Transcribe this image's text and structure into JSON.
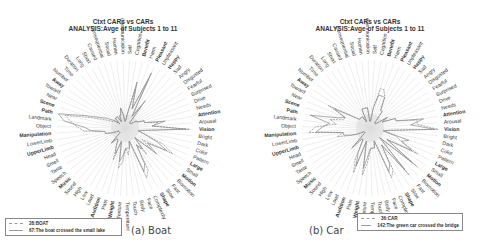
{
  "chart_data": [
    {
      "type": "radar",
      "panel": "a",
      "title": "Ctxt CARs vs CARs",
      "subtitle": "ANALYSIS:Avge of Subjects 1 to 11",
      "caption": "(a) Boat",
      "axes": [
        "Vision",
        "Bright",
        "Dark",
        "Color",
        "Pattern",
        "Large",
        "Small",
        "Motion",
        "Biomotion",
        "Fast",
        "Slow",
        "Shape",
        "Complexity",
        "Face",
        "Body",
        "Touch",
        "Temperature",
        "Texture",
        "Weight",
        "Pain",
        "Audition",
        "Loud",
        "Low",
        "High",
        "Sound",
        "Music",
        "Speech",
        "Taste",
        "Smell",
        "Head",
        "UpperLimb",
        "LowerLimb",
        "Manipulation",
        "Object",
        "Landmark",
        "Path",
        "Scene",
        "Near",
        "Toward",
        "Away",
        "Number",
        "Time",
        "Duration",
        "Long",
        "Short",
        "Caused",
        "Consequential",
        "Social",
        "Human",
        "Communication",
        "Self",
        "Cognition",
        "Benefit",
        "Harm",
        "Pleasant",
        "Unpleasant",
        "Happy",
        "Sad",
        "Angry",
        "Disgusted",
        "Fearful",
        "Surprised",
        "Drive",
        "Needs",
        "Attention",
        "Arousal"
      ],
      "series": [
        {
          "name": "28:BOAT",
          "style": "dashed",
          "values": [
            0.95,
            0.3,
            0.2,
            0.3,
            0.6,
            0.8,
            0.3,
            0.5,
            0.2,
            0.5,
            0.3,
            0.7,
            0.8,
            0.2,
            0.3,
            0.4,
            0.3,
            0.5,
            0.6,
            0.2,
            0.5,
            0.3,
            0.2,
            0.2,
            0.3,
            0.1,
            0.1,
            0.1,
            0.1,
            0.2,
            0.3,
            0.3,
            0.6,
            0.7,
            0.8,
            0.9,
            0.5,
            0.3,
            0.2,
            0.2,
            0.1,
            0.2,
            0.2,
            0.2,
            0.1,
            0.2,
            0.2,
            0.3,
            0.2,
            0.1,
            0.1,
            0.2,
            0.6,
            0.3,
            0.8,
            0.2,
            0.4,
            0.1,
            0.1,
            0.1,
            0.2,
            0.2,
            0.3,
            0.3,
            0.5,
            0.4
          ]
        },
        {
          "name": "67:The boat crossed the small lake",
          "style": "solid",
          "values": [
            0.9,
            0.3,
            0.2,
            0.3,
            0.5,
            0.7,
            0.4,
            0.6,
            0.2,
            0.4,
            0.3,
            0.6,
            0.7,
            0.2,
            0.3,
            0.3,
            0.3,
            0.4,
            0.5,
            0.2,
            0.4,
            0.3,
            0.2,
            0.2,
            0.3,
            0.1,
            0.1,
            0.1,
            0.1,
            0.2,
            0.3,
            0.3,
            0.5,
            0.6,
            0.9,
            1.0,
            0.6,
            0.4,
            0.3,
            0.2,
            0.1,
            0.2,
            0.2,
            0.2,
            0.1,
            0.2,
            0.2,
            0.3,
            0.2,
            0.1,
            0.1,
            0.2,
            0.7,
            0.3,
            0.9,
            0.2,
            0.5,
            0.1,
            0.1,
            0.1,
            0.2,
            0.2,
            0.3,
            0.3,
            0.6,
            0.4
          ]
        }
      ]
    },
    {
      "type": "radar",
      "panel": "b",
      "title": "Ctxt CARs vs CARs",
      "subtitle": "ANALYSIS:Avge of Subjects 1 to 11",
      "caption": "(b) Car",
      "axes": [
        "Vision",
        "Bright",
        "Dark",
        "Color",
        "Pattern",
        "Large",
        "Small",
        "Motion",
        "Biomotion",
        "Fast",
        "Slow",
        "Shape",
        "Complexity",
        "Face",
        "Body",
        "Touch",
        "Temperature",
        "Texture",
        "Weight",
        "Pain",
        "Audition",
        "Loud",
        "Low",
        "High",
        "Sound",
        "Music",
        "Speech",
        "Taste",
        "Smell",
        "Head",
        "UpperLimb",
        "LowerLimb",
        "Manipulation",
        "Object",
        "Landmark",
        "Path",
        "Scene",
        "Near",
        "Toward",
        "Away",
        "Number",
        "Time",
        "Duration",
        "Long",
        "Short",
        "Caused",
        "Consequential",
        "Social",
        "Human",
        "Communication",
        "Self",
        "Cognition",
        "Benefit",
        "Harm",
        "Pleasant",
        "Unpleasant",
        "Happy",
        "Sad",
        "Angry",
        "Disgusted",
        "Fearful",
        "Surprised",
        "Drive",
        "Needs",
        "Attention",
        "Arousal"
      ],
      "series": [
        {
          "name": "36:CAR",
          "style": "dashed",
          "values": [
            1.0,
            0.3,
            0.2,
            0.4,
            0.5,
            0.8,
            0.3,
            0.9,
            0.2,
            0.9,
            0.3,
            0.7,
            0.8,
            0.2,
            0.3,
            0.3,
            0.3,
            0.5,
            0.7,
            0.2,
            0.7,
            0.5,
            0.2,
            0.2,
            0.4,
            0.1,
            0.1,
            0.1,
            0.2,
            0.3,
            0.5,
            0.4,
            0.9,
            0.8,
            0.5,
            0.6,
            0.4,
            0.4,
            0.7,
            0.3,
            0.2,
            0.2,
            0.2,
            0.2,
            0.1,
            0.3,
            0.3,
            0.3,
            0.3,
            0.1,
            0.1,
            0.3,
            0.6,
            0.6,
            0.5,
            0.3,
            0.3,
            0.1,
            0.1,
            0.1,
            0.3,
            0.2,
            0.4,
            0.4,
            0.7,
            0.7
          ]
        },
        {
          "name": "142:The green car crossed the bridge",
          "style": "solid",
          "values": [
            0.95,
            0.3,
            0.2,
            0.6,
            0.5,
            0.7,
            0.3,
            0.8,
            0.2,
            0.8,
            0.3,
            0.6,
            0.7,
            0.2,
            0.3,
            0.3,
            0.3,
            0.4,
            0.6,
            0.2,
            0.6,
            0.4,
            0.2,
            0.2,
            0.4,
            0.1,
            0.1,
            0.1,
            0.2,
            0.3,
            0.4,
            0.4,
            0.8,
            0.7,
            0.6,
            0.9,
            0.5,
            0.4,
            0.6,
            0.3,
            0.2,
            0.2,
            0.2,
            0.2,
            0.1,
            0.3,
            0.3,
            0.3,
            0.3,
            0.1,
            0.1,
            0.3,
            0.5,
            0.5,
            0.5,
            0.3,
            0.3,
            0.1,
            0.1,
            0.1,
            0.3,
            0.2,
            0.4,
            0.4,
            0.8,
            0.6
          ]
        }
      ]
    }
  ],
  "panels": [
    {
      "title": "Ctxt CARs vs CARs",
      "subtitle": "ANALYSIS:Avge of Subjects 1 to 11",
      "caption": "(a) Boat",
      "legend": [
        "28:BOAT",
        "67:The boat crossed the small lake"
      ]
    },
    {
      "title": "Ctxt CARs vs CARs",
      "subtitle": "ANALYSIS:Avge of Subjects 1 to 11",
      "caption": "(b) Car",
      "legend": [
        "36:CAR",
        "142:The green car crossed the bridge"
      ]
    }
  ],
  "bold_axes": [
    "Vision",
    "Large",
    "Motion",
    "Shape",
    "Weight",
    "Audition",
    "Music",
    "Manipulation",
    "UpperLimb",
    "Path",
    "Scene",
    "Away",
    "Benefit",
    "Pleasant",
    "Happy",
    "Attention"
  ],
  "colors": {
    "line": "#8a8a8a",
    "spoke": "#dcdcdc",
    "label": "#333333"
  }
}
